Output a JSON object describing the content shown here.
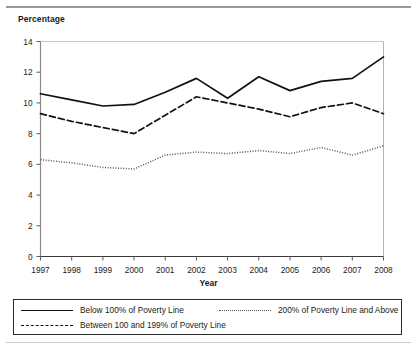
{
  "figure": {
    "y_axis_title": "Percentage",
    "x_axis_title": "Year"
  },
  "legend": {
    "items": [
      {
        "label": "Below 100% of Poverty Line",
        "style": "solid"
      },
      {
        "label": "Between 100 and 199% of Poverty Line",
        "style": "dashed"
      },
      {
        "label": "200% of Poverty Line and Above",
        "style": "dotted"
      }
    ]
  },
  "chart_data": {
    "type": "line",
    "title": "",
    "xlabel": "Year",
    "ylabel": "Percentage",
    "xlim": [
      1997,
      2008
    ],
    "ylim": [
      0,
      14
    ],
    "ytick_labels": [
      "0",
      "2",
      "4",
      "6",
      "8",
      "10",
      "12",
      "14"
    ],
    "yticks": [
      0,
      2,
      4,
      6,
      8,
      10,
      12,
      14
    ],
    "xtick_labels": [
      "1997",
      "1998",
      "1999",
      "2000",
      "2001",
      "2002",
      "2003",
      "2004",
      "2005",
      "2006",
      "2007",
      "2008"
    ],
    "categories": [
      1997,
      1998,
      1999,
      2000,
      2001,
      2002,
      2003,
      2004,
      2005,
      2006,
      2007,
      2008
    ],
    "grid": false,
    "legend_position": "bottom",
    "series": [
      {
        "name": "Below 100% of Poverty Line",
        "style": "solid",
        "color": "#111111",
        "values": [
          10.6,
          10.2,
          9.8,
          9.9,
          10.7,
          11.6,
          10.3,
          11.7,
          10.8,
          11.4,
          11.6,
          13.0
        ]
      },
      {
        "name": "Between 100 and 199% of Poverty Line",
        "style": "dashed",
        "color": "#111111",
        "values": [
          9.3,
          8.8,
          8.4,
          8.0,
          9.2,
          10.4,
          10.0,
          9.6,
          9.1,
          9.7,
          10.0,
          9.3
        ]
      },
      {
        "name": "200% of Poverty Line and Above",
        "style": "dotted",
        "color": "#555555",
        "values": [
          6.3,
          6.1,
          5.8,
          5.7,
          6.6,
          6.8,
          6.7,
          6.9,
          6.7,
          7.1,
          6.6,
          7.2
        ]
      }
    ]
  }
}
